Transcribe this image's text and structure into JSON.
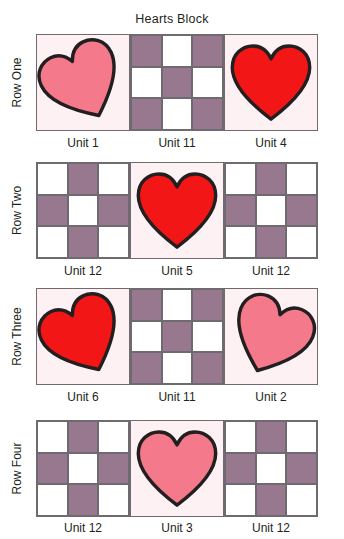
{
  "title": "Hearts Block",
  "colors": {
    "purple": "#98788f",
    "white": "#ffffff",
    "block_background": "#fdf1f4",
    "heart_pink": "#f4798a",
    "heart_red": "#f21616",
    "outline": "#231f20",
    "border": "#6e6a70"
  },
  "rows": [
    {
      "label": "Row One",
      "units": [
        {
          "name": "Unit 1",
          "type": "heart",
          "heart_color": "#f4798a",
          "tilt": "left"
        },
        {
          "name": "Unit 11",
          "type": "checker",
          "corner": "purple"
        },
        {
          "name": "Unit 4",
          "type": "heart",
          "heart_color": "#f21616",
          "tilt": "none"
        }
      ]
    },
    {
      "label": "Row Two",
      "units": [
        {
          "name": "Unit 12",
          "type": "checker",
          "corner": "white"
        },
        {
          "name": "Unit 5",
          "type": "heart",
          "heart_color": "#f21616",
          "tilt": "none"
        },
        {
          "name": "Unit 12",
          "type": "checker",
          "corner": "white"
        }
      ]
    },
    {
      "label": "Row Three",
      "units": [
        {
          "name": "Unit 6",
          "type": "heart",
          "heart_color": "#f21616",
          "tilt": "left"
        },
        {
          "name": "Unit 11",
          "type": "checker",
          "corner": "purple"
        },
        {
          "name": "Unit 2",
          "type": "heart",
          "heart_color": "#f4798a",
          "tilt": "right"
        }
      ]
    },
    {
      "label": "Row Four",
      "units": [
        {
          "name": "Unit 12",
          "type": "checker",
          "corner": "white"
        },
        {
          "name": "Unit 3",
          "type": "heart",
          "heart_color": "#f4798a",
          "tilt": "none"
        },
        {
          "name": "Unit 12",
          "type": "checker",
          "corner": "white"
        }
      ]
    }
  ]
}
